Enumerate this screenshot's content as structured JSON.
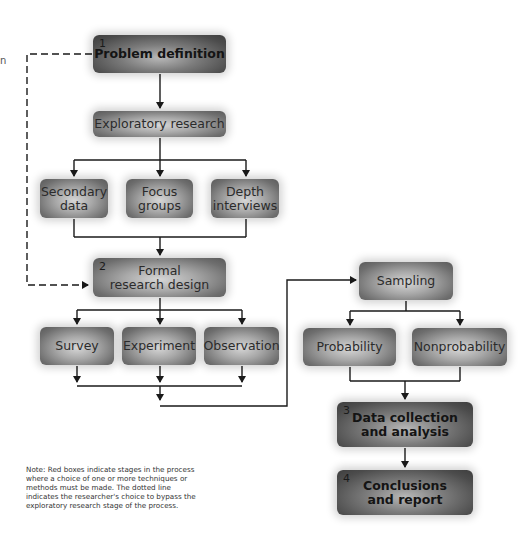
{
  "edge_fragment": "n",
  "nodes": {
    "problem_definition": {
      "number": "1",
      "label": "Problem definition",
      "decision": false
    },
    "exploratory_research": {
      "label": "Exploratory research",
      "decision": true
    },
    "secondary_data": {
      "label": "Secondary\ndata"
    },
    "focus_groups": {
      "label": "Focus\ngroups"
    },
    "depth_interviews": {
      "label": "Depth\ninterviews"
    },
    "formal_research_design": {
      "number": "2",
      "label": "Formal\nresearch design",
      "decision": true
    },
    "survey": {
      "label": "Survey"
    },
    "experiment": {
      "label": "Experiment"
    },
    "observation": {
      "label": "Observation"
    },
    "sampling": {
      "label": "Sampling",
      "decision": true
    },
    "probability": {
      "label": "Probability"
    },
    "nonprobability": {
      "label": "Nonprobability"
    },
    "data_collection": {
      "number": "3",
      "label": "Data collection\nand analysis"
    },
    "conclusions": {
      "number": "4",
      "label": "Conclusions\nand report"
    }
  },
  "edges": [
    [
      "problem_definition",
      "exploratory_research"
    ],
    [
      "exploratory_research",
      "secondary_data"
    ],
    [
      "exploratory_research",
      "focus_groups"
    ],
    [
      "exploratory_research",
      "depth_interviews"
    ],
    [
      "secondary_data",
      "formal_research_design"
    ],
    [
      "focus_groups",
      "formal_research_design"
    ],
    [
      "depth_interviews",
      "formal_research_design"
    ],
    [
      "problem_definition",
      "formal_research_design",
      "dashed-bypass"
    ],
    [
      "formal_research_design",
      "survey"
    ],
    [
      "formal_research_design",
      "experiment"
    ],
    [
      "formal_research_design",
      "observation"
    ],
    [
      "survey",
      "sampling"
    ],
    [
      "experiment",
      "sampling"
    ],
    [
      "observation",
      "sampling"
    ],
    [
      "sampling",
      "probability"
    ],
    [
      "sampling",
      "nonprobability"
    ],
    [
      "probability",
      "data_collection"
    ],
    [
      "nonprobability",
      "data_collection"
    ],
    [
      "data_collection",
      "conclusions"
    ]
  ],
  "note": "Note: Red boxes indicate stages in the process where a choice of one or more techniques or methods must be made. The dotted line indicates the researcher's choice to bypass the exploratory research stage of the process.",
  "colors": {
    "line": "#1a1a1a",
    "box_light": "#a8a8a8",
    "box_dark": "#4c4c4c",
    "background": "#ffffff"
  }
}
